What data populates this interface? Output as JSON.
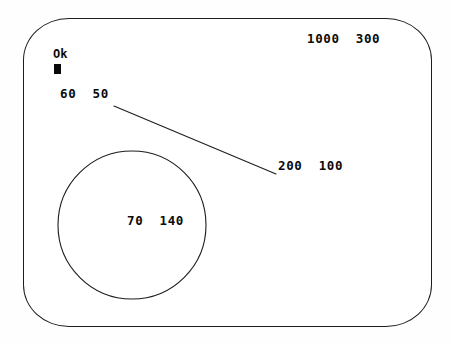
{
  "screen": {
    "device": "crt-monitor-screen",
    "background_color": "#ffffff",
    "outline_color": "#1d1d1d",
    "text_color": "#0a0a0a"
  },
  "terminal": {
    "prompt_label": "Ok",
    "cursor_glyph": "cursor-block",
    "labels": {
      "row_60_50": "60  50",
      "row_1000_300": "1000  300",
      "row_200_100": "200  100",
      "row_70_140": "70  140"
    }
  },
  "graphics": {
    "line": {
      "name": "diagonal-line",
      "x1": 114,
      "y1": 106,
      "x2": 276,
      "y2": 174,
      "stroke": "#1d1d1d",
      "stroke_width": 1.1
    },
    "circle": {
      "name": "drawn-circle",
      "cx": 132,
      "cy": 225,
      "r": 74,
      "stroke": "#1d1d1d",
      "stroke_width": 1.1,
      "fill": "none"
    },
    "bezel": {
      "name": "crt-bezel-outline",
      "x": 23,
      "y": 18,
      "width": 409,
      "height": 309,
      "radius_x": 46,
      "radius_y": 42
    }
  }
}
